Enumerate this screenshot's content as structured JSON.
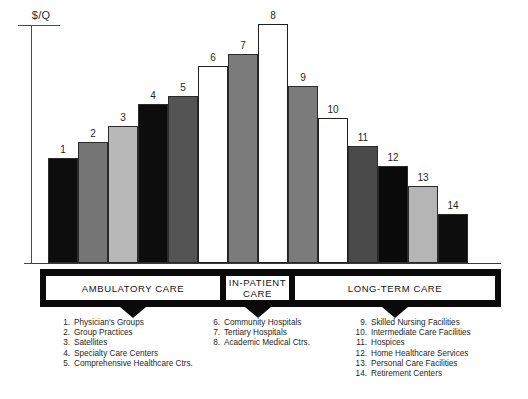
{
  "figure": {
    "yaxis_label": "$/Q",
    "caption": ""
  },
  "chart_data": {
    "type": "bar",
    "title": "",
    "xlabel": "",
    "ylabel": "$/Q",
    "grid": false,
    "legend_position": "below",
    "note": "Continuum-of-care cost/intensity profile; bar heights are relative ($/Q) with no numeric axis ticks shown.",
    "categories": [
      "Physician's Groups",
      "Group Practices",
      "Satellites",
      "Specialty Care Centers",
      "Comprehensive Healthcare Ctrs.",
      "Community Hospitals",
      "Tertiary Hospitals",
      "Academic Medical Ctrs.",
      "Skilled Nursing Facilities",
      "Intermediate Care Facilities",
      "Hospices",
      "Home Healthcare Services",
      "Personal Care Facilities",
      "Retirement Centers"
    ],
    "labels": [
      "1",
      "2",
      "3",
      "4",
      "5",
      "6",
      "7",
      "8",
      "9",
      "10",
      "11",
      "12",
      "13",
      "14"
    ],
    "values": [
      44,
      51,
      57,
      67,
      70,
      82,
      87,
      100,
      74,
      61,
      49,
      41,
      32,
      21
    ],
    "ylim": [
      0,
      110
    ],
    "bar_fills": [
      "#0d0d0d",
      "#757575",
      "#b8b8b8",
      "#0d0d0d",
      "#545454",
      "#ffffff",
      "#7b7b7b",
      "#ffffff",
      "#7b7b7b",
      "#ffffff",
      "#4a4a4a",
      "#0a0a0a",
      "#b5b5b5",
      "#0d0d0d"
    ],
    "bar_tops_px": [
      158,
      142,
      126,
      104,
      96,
      66,
      54,
      24,
      86,
      118,
      146,
      166,
      186,
      214
    ],
    "baseline_px": 263,
    "bar_left_px": [
      48,
      78,
      108,
      138,
      168,
      198,
      228,
      258,
      288,
      318,
      348,
      378,
      408,
      438
    ],
    "bar_width_px": 30
  },
  "bands": [
    {
      "label": "AMBULATORY CARE",
      "left": 45,
      "width": 176
    },
    {
      "label": "IN-PATIENT\nCARE",
      "label_line1": "IN-PATIENT",
      "label_line2": "CARE",
      "left": 225,
      "width": 65
    },
    {
      "label": "LONG-TERM CARE",
      "left": 294,
      "width": 202
    }
  ],
  "legend": {
    "column_1": [
      {
        "num": "1.",
        "text": "Physician's Groups"
      },
      {
        "num": "2.",
        "text": "Group Practices"
      },
      {
        "num": "3.",
        "text": "Satellites"
      },
      {
        "num": "4.",
        "text": "Specialty Care Centers"
      },
      {
        "num": "5.",
        "text": "Comprehensive Healthcare Ctrs."
      }
    ],
    "column_2": [
      {
        "num": "6.",
        "text": "Community Hospitals"
      },
      {
        "num": "7.",
        "text": "Tertiary Hospitals"
      },
      {
        "num": "8.",
        "text": "Academic Medical Ctrs."
      }
    ],
    "column_3": [
      {
        "num": "9.",
        "text": "Skilled Nursing Facilities"
      },
      {
        "num": "10.",
        "text": "Intermediate Care Facilities"
      },
      {
        "num": "11.",
        "text": "Hospices"
      },
      {
        "num": "12.",
        "text": "Home Healthcare Services"
      },
      {
        "num": "13.",
        "text": "Personal Care Facilities"
      },
      {
        "num": "14.",
        "text": "Retirement Centers"
      }
    ]
  }
}
